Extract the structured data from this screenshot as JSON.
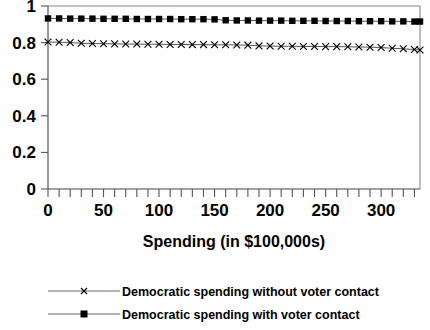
{
  "chart_data": {
    "type": "line",
    "title": "",
    "subtitle": "",
    "xlabel": "Spending (in $100,000s)",
    "ylabel": "",
    "xlim": [
      0,
      335
    ],
    "ylim": [
      0,
      1
    ],
    "grid": false,
    "legend_position": "bottom",
    "xticks": [
      0,
      50,
      100,
      150,
      200,
      250,
      300
    ],
    "xtick_labels": [
      "0",
      "50",
      "100",
      "150",
      "200",
      "250",
      "300"
    ],
    "yticks": [
      0,
      0.2,
      0.4,
      0.6,
      0.8,
      1
    ],
    "ytick_labels": [
      "0",
      "0.2",
      "0.4",
      "0.6",
      "0.8",
      "1"
    ],
    "x": [
      0,
      10,
      20,
      30,
      40,
      50,
      60,
      70,
      80,
      90,
      100,
      110,
      120,
      130,
      140,
      150,
      160,
      170,
      180,
      190,
      200,
      210,
      220,
      230,
      240,
      250,
      260,
      270,
      280,
      290,
      300,
      310,
      320,
      330,
      335
    ],
    "series": [
      {
        "name": "Democratic spending without voter contact",
        "marker": "x",
        "values": [
          0.803,
          0.802,
          0.801,
          0.796,
          0.795,
          0.794,
          0.793,
          0.792,
          0.792,
          0.791,
          0.791,
          0.79,
          0.79,
          0.789,
          0.789,
          0.788,
          0.788,
          0.787,
          0.786,
          0.782,
          0.781,
          0.78,
          0.78,
          0.779,
          0.779,
          0.778,
          0.778,
          0.777,
          0.776,
          0.775,
          0.773,
          0.769,
          0.766,
          0.762,
          0.76
        ]
      },
      {
        "name": "Democratic spending with voter contact",
        "marker": "square",
        "values": [
          0.932,
          0.932,
          0.931,
          0.931,
          0.931,
          0.93,
          0.93,
          0.93,
          0.929,
          0.929,
          0.929,
          0.929,
          0.928,
          0.928,
          0.928,
          0.927,
          0.922,
          0.921,
          0.921,
          0.92,
          0.92,
          0.92,
          0.919,
          0.919,
          0.919,
          0.918,
          0.918,
          0.918,
          0.917,
          0.917,
          0.917,
          0.916,
          0.916,
          0.915,
          0.915
        ]
      }
    ],
    "colors": {
      "line": "#555555",
      "marker": "#000000",
      "axis": "#444444",
      "frame": "#888888",
      "text": "#000000",
      "background": "#ffffff"
    }
  },
  "legend": {
    "entries": [
      {
        "label": "Democratic spending without voter contact",
        "marker": "x-marker"
      },
      {
        "label": "Democratic spending with voter contact",
        "marker": "square-marker"
      }
    ]
  },
  "axes": {
    "x_axis_title": "Spending (in $100,000s)"
  }
}
